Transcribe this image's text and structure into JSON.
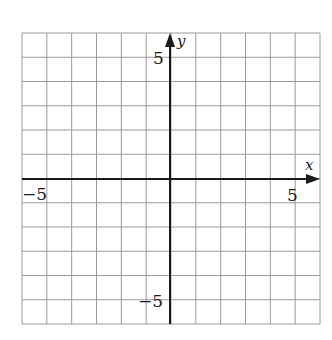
{
  "chart_data": {
    "type": "scatter",
    "title": "",
    "xlabel": "x",
    "ylabel": "y",
    "xlim": [
      -6,
      6
    ],
    "ylim": [
      -6,
      6
    ],
    "grid": true,
    "grid_step": 1,
    "x_tick_labels": [
      {
        "value": -5,
        "label": "−5"
      },
      {
        "value": 5,
        "label": "5"
      }
    ],
    "y_tick_labels": [
      {
        "value": 5,
        "label": "5"
      },
      {
        "value": -5,
        "label": "−5"
      }
    ],
    "series": [],
    "legend": null,
    "colors": {
      "grid": "#9a9a9a",
      "axis": "#1a1a1a",
      "background": "#ffffff"
    }
  },
  "labels": {
    "x_axis": "x",
    "y_axis": "y",
    "x_neg5": "−5",
    "x_pos5": "5",
    "y_pos5": "5",
    "y_neg5": "−5"
  }
}
